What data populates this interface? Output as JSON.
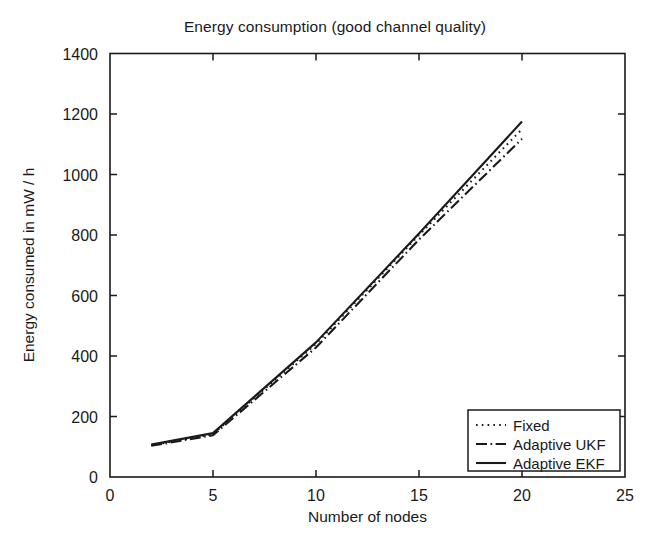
{
  "chart_data": {
    "type": "line",
    "title": "Energy consumption (good channel quality)",
    "xlabel": "Number of nodes",
    "ylabel": "Energy consumed in mW / h",
    "xlim": [
      0,
      25
    ],
    "ylim": [
      0,
      1400
    ],
    "xticks": [
      0,
      5,
      10,
      15,
      20,
      25
    ],
    "yticks": [
      0,
      200,
      400,
      600,
      800,
      1000,
      1200,
      1400
    ],
    "xtick_labels": [
      "0",
      "5",
      "10",
      "15",
      "20",
      "25"
    ],
    "ytick_labels": [
      "0",
      "200",
      "400",
      "600",
      "800",
      "1000",
      "1200",
      "1400"
    ],
    "grid": false,
    "legend_position": "lower right",
    "x": [
      2,
      5,
      10,
      15,
      20
    ],
    "series": [
      {
        "name": "Fixed",
        "style": "dotted",
        "color": "#1a1a1a",
        "values": [
          105,
          142,
          440,
          800,
          1150
        ]
      },
      {
        "name": "Adaptive UKF",
        "style": "dash-dot",
        "color": "#1a1a1a",
        "values": [
          103,
          138,
          428,
          785,
          1118
        ]
      },
      {
        "name": "Adaptive EKF",
        "style": "solid",
        "color": "#1a1a1a",
        "values": [
          107,
          145,
          445,
          805,
          1175
        ]
      }
    ]
  },
  "legend": {
    "entries": [
      {
        "label": "Fixed",
        "style": "dotted"
      },
      {
        "label": "Adaptive UKF",
        "style": "dash-dot"
      },
      {
        "label": "Adaptive EKF",
        "style": "solid"
      }
    ]
  },
  "axes": {
    "box_color": "#1a1a1a",
    "tick_direction": "in"
  }
}
